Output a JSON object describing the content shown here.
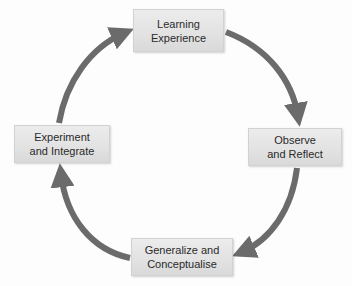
{
  "diagram": {
    "type": "cycle",
    "direction": "clockwise",
    "colors": {
      "arrow": "#6b6b6b",
      "box_fill": "#e4e4e4",
      "box_border": "#d2d2d2",
      "text": "#2a2a2a",
      "background": "#ffffff"
    },
    "nodes": [
      {
        "id": "learning-experience",
        "position": "top",
        "line1": "Learning",
        "line2": "Experience"
      },
      {
        "id": "observe-reflect",
        "position": "right",
        "line1": "Observe",
        "line2": "and Reflect"
      },
      {
        "id": "generalize-conceptualise",
        "position": "bottom",
        "line1": "Generalize and",
        "line2": "Conceptualise"
      },
      {
        "id": "experiment-integrate",
        "position": "left",
        "line1": "Experiment",
        "line2": "and Integrate"
      }
    ],
    "edges": [
      {
        "from": "learning-experience",
        "to": "observe-reflect"
      },
      {
        "from": "observe-reflect",
        "to": "generalize-conceptualise"
      },
      {
        "from": "generalize-conceptualise",
        "to": "experiment-integrate"
      },
      {
        "from": "experiment-integrate",
        "to": "learning-experience"
      }
    ]
  }
}
